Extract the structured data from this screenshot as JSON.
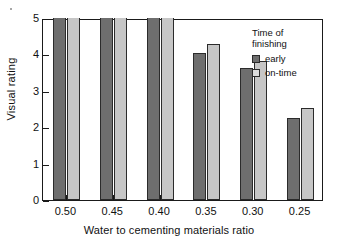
{
  "chart_data": {
    "type": "bar",
    "title": "",
    "xlabel": "Water to cementing materials ratio",
    "ylabel": "Visual rating",
    "categories": [
      "0.50",
      "0.45",
      "0.40",
      "0.35",
      "0.30",
      "0.25"
    ],
    "series": [
      {
        "name": "early",
        "values": [
          5.0,
          5.0,
          5.0,
          4.05,
          3.62,
          2.25
        ]
      },
      {
        "name": "on-time",
        "values": [
          5.0,
          5.0,
          5.0,
          4.28,
          3.81,
          2.53
        ]
      }
    ],
    "ylim": [
      0,
      5
    ],
    "yticks": [
      "0",
      "1",
      "2",
      "3",
      "4",
      "5"
    ],
    "grid": false,
    "legend": {
      "position": "top-right",
      "title": "Time of\nfinishing",
      "entries": [
        {
          "label": "early",
          "color": "#6e6e6e"
        },
        {
          "label": "on-time",
          "color": "#dcdcdc"
        }
      ]
    }
  },
  "axes": {
    "y": {
      "label": "Visual rating",
      "ticks": [
        "0",
        "1",
        "2",
        "3",
        "4",
        "5"
      ]
    },
    "x": {
      "label": "Water to cementing materials ratio",
      "ticks": [
        "0.50",
        "0.45",
        "0.40",
        "0.35",
        "0.30",
        "0.25"
      ]
    }
  },
  "legend": {
    "title": "Time of\nfinishing",
    "early_label": "early",
    "ontime_label": "on-time"
  }
}
